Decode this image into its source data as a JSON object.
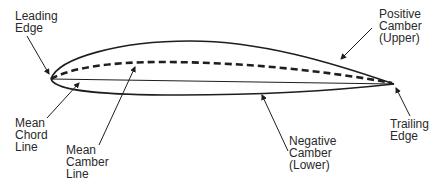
{
  "diagram": {
    "labels": {
      "leading_edge": "Leading\nEdge",
      "positive_camber": "Positive\nCamber\n(Upper)",
      "mean_chord_line": "Mean\nChord\nLine",
      "mean_camber_line": "Mean\nCamber\nLine",
      "negative_camber": "Negative\nCamber\n(Lower)",
      "trailing_edge": "Trailing\nEdge"
    },
    "colors": {
      "stroke": "#1e1e1e",
      "text": "#2a2a2a",
      "background": "#ffffff"
    }
  }
}
